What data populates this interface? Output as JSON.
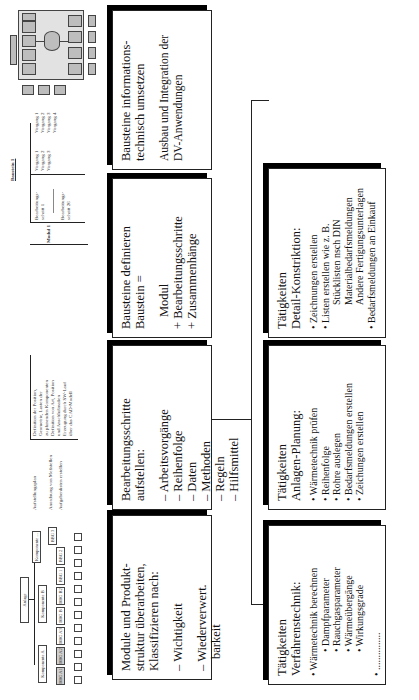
{
  "thumbnails": {
    "hierarchy": {
      "root": "Anlage",
      "components": [
        "Komponente A",
        "Komponente B",
        "Komponente ..."
      ],
      "subcomponents": [
        "BBG A1",
        "BBG A2",
        "BBG A3",
        "BBG B",
        "BBG B2",
        "BBG 1",
        "BBG 2",
        "BBG 3"
      ],
      "leaf_count": 12
    },
    "process_table": {
      "rows": [
        {
          "step": "Aufstellungsplan",
          "desc": [
            "Definition der Position,",
            "Geometrie, Lasten der",
            "zu planenden Komponenten",
            "Definition von Art, Position",
            "und Anschlußmaßen",
            "Erzeugung durch SW-Lauf",
            "über das CAD-Modell"
          ]
        },
        {
          "step": "Anordnung von Meßstellen",
          "desc": []
        },
        {
          "step": "Aufgabenlisten erstellen",
          "desc": []
        }
      ]
    },
    "baustein_table": {
      "title": "Baustein 1",
      "module": "Modul 1",
      "steps": [
        {
          "label": "Bearbeitungs-schritt 1",
          "vorgaenge": [
            "Vorgang 1",
            "Vorgang 2",
            "Vorgang 3"
          ]
        },
        {
          "label": "Bearbeitungs-schritt 26",
          "vorgaenge": [
            "Vorgang 1",
            "Vorgang 2",
            "Vorgang 3",
            "Vorgang 4"
          ]
        }
      ]
    },
    "system_diagram": {
      "label": "DV-System-Architektur"
    }
  },
  "boxes": {
    "module": {
      "title": [
        "Module und Produkt-",
        "struktur überarbeiten,",
        "Klassifizieren nach:"
      ],
      "items": [
        "– Wichtigkeit",
        "– Wiederverwert.",
        "barkeit"
      ]
    },
    "bearbeitung": {
      "title": [
        "Bearbeitungsschritte",
        "aufstellen:"
      ],
      "items": [
        "– Arbeitsvorgänge",
        "– Reihenfolge",
        "– Daten",
        "– Methoden",
        "– Regeln",
        "– Hilfsmittel"
      ]
    },
    "bausteine_def": {
      "title": [
        "Bausteine definieren",
        "Baustein ="
      ],
      "items": [
        "Modul",
        "+ Bearbeitungsschritte",
        "+ Zusammenhänge"
      ]
    },
    "bausteine_it": {
      "title": [
        "Bausteine informations-",
        "technisch umsetzen"
      ],
      "items": [
        "Ausbau und Integration der",
        "DV-Anwendungen"
      ]
    },
    "verfahren": {
      "title": [
        "Tätigkeiten",
        "Verfahrenstechnik:"
      ],
      "items": [
        "• Wärmetechnik berechnen",
        "• Dampfparameter",
        "• Rauchgasparameter",
        "• Wärmeübergänge",
        "• Wirkungsgrade",
        "• ..............."
      ]
    },
    "anlagen": {
      "title": [
        "Tätigkeiten",
        "Anlagen-Planung:"
      ],
      "items": [
        "• Wärmetechnik prüfen",
        "• Reihenfolge",
        "• Rohre auslegen",
        "• Bedarfsmeldungen erstellen",
        "• Zeichungen erstellen"
      ]
    },
    "detail": {
      "title": [
        "Tätigkeiten",
        "Detail-Konstriktion:"
      ],
      "items": [
        "• Zeichnungen erstellen",
        "• Listen erstellen wie z. B.",
        "Stücklisten nsch DIN",
        "Materialbedarfsmeldungen",
        "Andere Fertigungsunterlagen",
        "• Bedarfsmeldungen an Einkauf"
      ]
    }
  }
}
